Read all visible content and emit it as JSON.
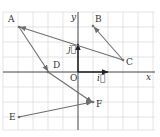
{
  "diagram": {
    "type": "vector-grid",
    "grid": {
      "spacing": 15,
      "color": "#d8d8d8"
    },
    "axes": {
      "x_label": "x",
      "y_label": "y",
      "origin_label": "O",
      "unit_i_label": "i⃗",
      "unit_j_label": "j⃗"
    },
    "points": [
      {
        "name": "A",
        "label": "A"
      },
      {
        "name": "B",
        "label": "B"
      },
      {
        "name": "C",
        "label": "C"
      },
      {
        "name": "D",
        "label": "D"
      },
      {
        "name": "E",
        "label": "E"
      },
      {
        "name": "F",
        "label": "F"
      }
    ],
    "vectors": [
      {
        "from": "C",
        "to": "A"
      },
      {
        "from": "C",
        "to": "B"
      },
      {
        "from": "A",
        "to": "D"
      },
      {
        "from": "D",
        "to": "F"
      },
      {
        "from": "E",
        "to": "F"
      }
    ],
    "colors": {
      "vector": "#6e6e6e",
      "axis": "#444444",
      "grid": "#d8d8d8"
    }
  }
}
